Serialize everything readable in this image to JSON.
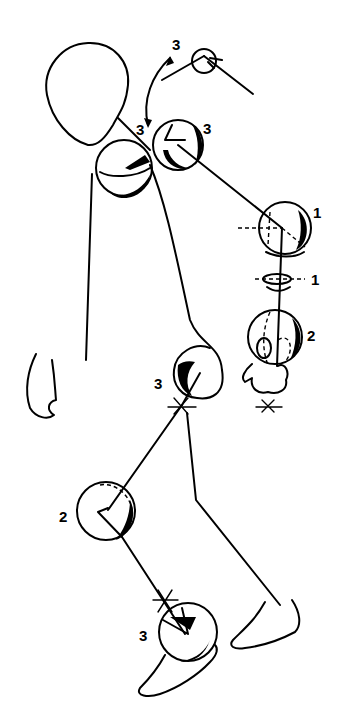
{
  "diagram": {
    "title": "",
    "labels": {
      "neck_top": "3",
      "neck": "3",
      "shoulder": "3",
      "elbow": "1",
      "forearm": "1",
      "wrist": "2",
      "hip": "3",
      "knee": "2",
      "ankle": "3"
    },
    "colors": {
      "ink": "#000000",
      "background": "#ffffff"
    }
  }
}
